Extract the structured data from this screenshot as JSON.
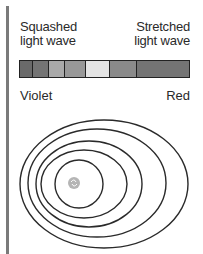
{
  "labels": {
    "left_line1": "Squashed",
    "left_line2": "light wave",
    "right_line1": "Stretched",
    "right_line2": "light wave",
    "violet": "Violet",
    "red": "Red"
  },
  "spectrum": {
    "bands": [
      {
        "name": "band-1",
        "color": "#6a6a6a",
        "width": 13
      },
      {
        "name": "band-2",
        "color": "#747474",
        "width": 16
      },
      {
        "name": "band-3",
        "color": "#a9a9a9",
        "width": 17
      },
      {
        "name": "band-4",
        "color": "#989898",
        "width": 21
      },
      {
        "name": "band-5",
        "color": "#e4e4e4",
        "width": 24
      },
      {
        "name": "band-6",
        "color": "#8a8a8a",
        "width": 27
      },
      {
        "name": "band-7",
        "color": "#747474",
        "width": 53
      }
    ]
  },
  "waves": {
    "stroke": "#2a2a2a",
    "ellipses": [
      {
        "cx": 104,
        "cy": 184,
        "rx": 84,
        "ry": 64
      },
      {
        "cx": 97,
        "cy": 183,
        "rx": 69,
        "ry": 54
      },
      {
        "cx": 89,
        "cy": 184,
        "rx": 53,
        "ry": 43
      },
      {
        "cx": 84,
        "cy": 184,
        "rx": 43,
        "ry": 34
      },
      {
        "cx": 79,
        "cy": 184,
        "rx": 24,
        "ry": 24
      }
    ],
    "source": {
      "cx": 74,
      "cy": 183,
      "r": 6,
      "color": "#b5b5b5"
    }
  }
}
